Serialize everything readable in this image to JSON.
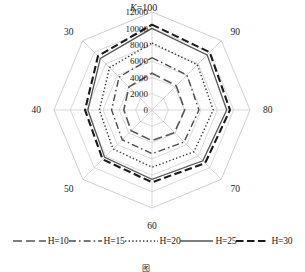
{
  "chart_data": {
    "type": "radar",
    "title": "K=100",
    "title_prefix": "K",
    "title_suffix": "=100",
    "categories": [
      "100",
      "90",
      "80",
      "70",
      "60",
      "50",
      "40",
      "30"
    ],
    "rlim": [
      0,
      12000
    ],
    "rticks": [
      0,
      2000,
      4000,
      6000,
      8000,
      10000,
      12000
    ],
    "rtick_labels": [
      "0",
      "2000",
      "4000",
      "6000",
      "8000",
      "10000",
      "12000"
    ],
    "grid": true,
    "grid_color": "#c9c9c9",
    "legend_position": "bottom",
    "series": [
      {
        "name": "H=10",
        "label": "H=10",
        "dash": "long-dash",
        "color": "#555555",
        "width": 1.6,
        "values": [
          4500,
          4200,
          4000,
          3900,
          3750,
          3600,
          3450,
          4000
        ]
      },
      {
        "name": "H=15",
        "label": "H=15",
        "dash": "dash-dot",
        "color": "#4a4a4a",
        "width": 1.4,
        "values": [
          6400,
          6050,
          5750,
          5550,
          5350,
          5150,
          4950,
          5700
        ]
      },
      {
        "name": "H=20",
        "label": "H=20",
        "dash": "dotted",
        "color": "#3a3a3a",
        "width": 1.4,
        "values": [
          8200,
          7850,
          7500,
          7250,
          7000,
          6750,
          6450,
          7350
        ]
      },
      {
        "name": "H=25",
        "label": "H=25",
        "dash": "solid",
        "color": "#555555",
        "width": 1.3,
        "values": [
          10000,
          9550,
          9150,
          8800,
          8500,
          8200,
          7850,
          8950
        ]
      },
      {
        "name": "H=30",
        "label": "H=30",
        "dash": "thick-dash",
        "color": "#1a1a1a",
        "width": 2.1,
        "values": [
          10450,
          10000,
          9550,
          9200,
          8850,
          8550,
          8200,
          9350
        ]
      }
    ]
  },
  "caption": {
    "number": "图",
    "text": ""
  }
}
